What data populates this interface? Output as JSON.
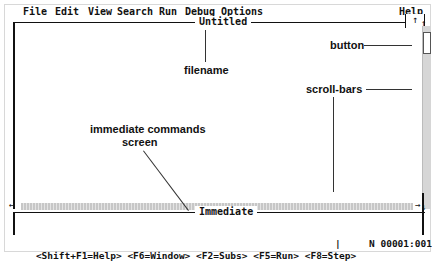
{
  "menubar": {
    "items": [
      "File",
      "Edit",
      "View",
      "Search",
      "Run",
      "Debug",
      "Options"
    ],
    "help": "Help"
  },
  "editor": {
    "title": "Untitled",
    "up_button": "↑",
    "scroll_up_arrow": "↑",
    "scroll_down_arrow": "↓",
    "scroll_left_arrow": "←",
    "scroll_right_arrow": "→"
  },
  "immediate": {
    "title": "Immediate"
  },
  "statusbar": {
    "keys": "<Shift+F1=Help> <F6=Window> <F2=Subs> <F5=Run> <F8=Step>",
    "separator": "|",
    "position": "N 00001:001"
  },
  "annotations": {
    "button": "button",
    "filename": "filename",
    "scroll_bars": "scroll-bars",
    "immediate_line1": "immediate commands",
    "immediate_line2": "screen"
  }
}
